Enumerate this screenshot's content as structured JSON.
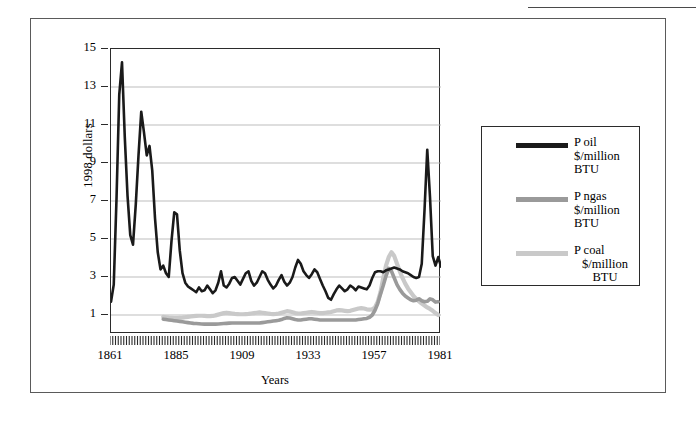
{
  "figure": {
    "outer_frame": true,
    "top_rule_artifact": true
  },
  "chart_data": {
    "type": "line",
    "title": "",
    "xlabel": "Years",
    "ylabel": "1998 dollars",
    "xlim": [
      1861,
      1981
    ],
    "ylim": [
      0,
      15
    ],
    "yticks": [
      1,
      3,
      5,
      7,
      9,
      11,
      13,
      15
    ],
    "xticks": [
      1861,
      1885,
      1909,
      1933,
      1957,
      1981
    ],
    "xtick_minor_interval": 1,
    "grid": "horizontal",
    "legend_position": "right-outside",
    "colors": {
      "oil": "#1a1a1a",
      "ngas": "#9a9a9a",
      "coal": "#c9c9c9",
      "axis": "#2b2b2b",
      "gridline": "#b5b5b5",
      "frame": "#5a5a5a",
      "background": "#ffffff"
    },
    "series": [
      {
        "name": "P oil",
        "legend_label_lines": [
          "P oil",
          "$/million",
          "BTU"
        ],
        "unit": "$/million BTU",
        "color": "#1a1a1a",
        "x_start": 1861,
        "values": [
          1.7,
          2.6,
          7.1,
          12.6,
          14.3,
          10.4,
          7.3,
          5.2,
          4.7,
          6.8,
          9.4,
          11.7,
          10.6,
          9.4,
          9.9,
          8.6,
          6.1,
          4.3,
          3.4,
          3.6,
          3.2,
          3.0,
          4.9,
          6.4,
          6.3,
          4.4,
          3.2,
          2.7,
          2.5,
          2.4,
          2.3,
          2.2,
          2.45,
          2.25,
          2.3,
          2.55,
          2.35,
          2.15,
          2.3,
          2.7,
          3.3,
          2.55,
          2.45,
          2.65,
          2.95,
          3.0,
          2.8,
          2.6,
          2.9,
          3.2,
          3.3,
          2.8,
          2.55,
          2.7,
          3.0,
          3.3,
          3.2,
          2.85,
          2.6,
          2.4,
          2.55,
          2.85,
          3.1,
          2.75,
          2.55,
          2.7,
          3.0,
          3.5,
          3.9,
          3.7,
          3.3,
          3.1,
          2.95,
          3.15,
          3.4,
          3.25,
          2.9,
          2.55,
          2.25,
          1.9,
          1.8,
          2.1,
          2.35,
          2.55,
          2.4,
          2.25,
          2.35,
          2.55,
          2.45,
          2.3,
          2.5,
          2.45,
          2.4,
          2.35,
          2.55,
          2.95,
          3.25,
          3.3,
          3.3,
          3.25,
          3.35,
          3.4,
          3.45,
          3.5,
          3.45,
          3.4,
          3.3,
          3.25,
          3.2,
          3.1,
          3.0,
          2.95,
          3.0,
          3.7,
          6.5,
          9.7,
          7.2,
          4.1,
          3.6,
          4.05,
          3.55,
          3.15,
          2.55,
          2.85,
          2.45,
          2.05
        ]
      },
      {
        "name": "P ngas",
        "legend_label_lines": [
          "P ngas",
          "$/million",
          "BTU"
        ],
        "unit": "$/million BTU",
        "color": "#9a9a9a",
        "x_start": 1880,
        "values": [
          0.78,
          0.76,
          0.74,
          0.72,
          0.7,
          0.68,
          0.66,
          0.64,
          0.62,
          0.6,
          0.58,
          0.56,
          0.55,
          0.54,
          0.53,
          0.52,
          0.52,
          0.52,
          0.52,
          0.52,
          0.53,
          0.54,
          0.55,
          0.56,
          0.57,
          0.58,
          0.58,
          0.58,
          0.58,
          0.58,
          0.58,
          0.58,
          0.58,
          0.58,
          0.58,
          0.58,
          0.6,
          0.62,
          0.64,
          0.66,
          0.68,
          0.7,
          0.72,
          0.76,
          0.82,
          0.86,
          0.84,
          0.8,
          0.76,
          0.74,
          0.74,
          0.76,
          0.78,
          0.8,
          0.8,
          0.78,
          0.76,
          0.74,
          0.74,
          0.74,
          0.74,
          0.74,
          0.74,
          0.74,
          0.74,
          0.74,
          0.74,
          0.74,
          0.74,
          0.74,
          0.74,
          0.76,
          0.78,
          0.8,
          0.82,
          0.88,
          1.0,
          1.25,
          1.6,
          2.1,
          2.55,
          3.05,
          3.45,
          3.3,
          2.95,
          2.6,
          2.35,
          2.15,
          2.0,
          1.9,
          1.8,
          1.75,
          1.78,
          1.85,
          1.75,
          1.7,
          1.72,
          1.85,
          1.8,
          1.68,
          1.7
        ]
      },
      {
        "name": "P coal",
        "legend_label_lines": [
          "P coal",
          "$/million",
          "BTU"
        ],
        "unit": "$/million BTU",
        "color": "#c9c9c9",
        "x_start": 1880,
        "values": [
          0.9,
          0.88,
          0.86,
          0.85,
          0.84,
          0.84,
          0.85,
          0.86,
          0.88,
          0.9,
          0.92,
          0.94,
          0.95,
          0.96,
          0.96,
          0.95,
          0.94,
          0.94,
          0.95,
          0.98,
          1.02,
          1.06,
          1.1,
          1.12,
          1.1,
          1.08,
          1.06,
          1.05,
          1.04,
          1.04,
          1.05,
          1.06,
          1.08,
          1.1,
          1.12,
          1.14,
          1.12,
          1.1,
          1.08,
          1.06,
          1.05,
          1.06,
          1.08,
          1.12,
          1.16,
          1.2,
          1.18,
          1.14,
          1.1,
          1.08,
          1.08,
          1.1,
          1.12,
          1.14,
          1.16,
          1.14,
          1.12,
          1.1,
          1.1,
          1.12,
          1.14,
          1.16,
          1.2,
          1.24,
          1.26,
          1.24,
          1.22,
          1.2,
          1.22,
          1.26,
          1.3,
          1.34,
          1.36,
          1.34,
          1.3,
          1.28,
          1.3,
          1.4,
          1.7,
          2.2,
          2.95,
          3.6,
          4.05,
          4.3,
          4.1,
          3.7,
          3.3,
          2.95,
          2.65,
          2.4,
          2.2,
          2.0,
          1.85,
          1.72,
          1.6,
          1.5,
          1.4,
          1.32,
          1.22,
          1.1,
          1.0
        ]
      }
    ]
  },
  "axes": {
    "ytick_labels": [
      "15",
      "13",
      "11",
      "9",
      "7",
      "5",
      "3",
      "1"
    ],
    "xtick_labels": [
      "1861",
      "1885",
      "1909",
      "1933",
      "1957",
      "1981"
    ],
    "xaxis_title": "Years",
    "yaxis_title": "1998 dollars"
  },
  "legend": {
    "items": [
      {
        "label_1": "P oil",
        "label_2": "$/million",
        "label_3": "BTU",
        "swatch_color": "#1a1a1a"
      },
      {
        "label_1": "P ngas",
        "label_2": "$/million",
        "label_3": "BTU",
        "swatch_color": "#9a9a9a"
      },
      {
        "label_1": "P coal",
        "label_2": "$/million",
        "label_3": "BTU",
        "swatch_color": "#c9c9c9"
      }
    ]
  }
}
